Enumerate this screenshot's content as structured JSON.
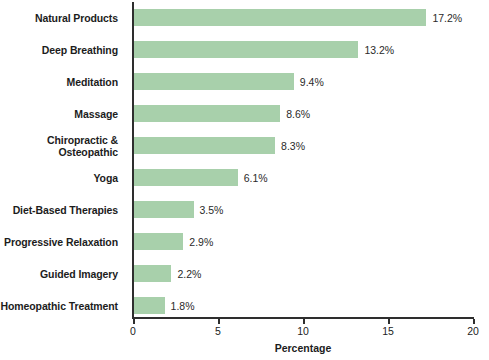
{
  "chart_data": {
    "type": "bar",
    "orientation": "horizontal",
    "title": "",
    "xlabel": "Percentage",
    "ylabel": "",
    "xlim": [
      0,
      20
    ],
    "xticks": [
      "0",
      "5",
      "10",
      "15",
      "20"
    ],
    "grid": false,
    "legend": false,
    "bar_color": "#a8d0ab",
    "axis_color": "#2e2e2e",
    "categories": [
      "Natural Products",
      "Deep Breathing",
      "Meditation",
      "Massage",
      "Chiropractic & Osteopathic",
      "Yoga",
      "Diet-Based Therapies",
      "Progressive Relaxation",
      "Guided Imagery",
      "Homeopathic Treatment"
    ],
    "values": [
      17.2,
      13.2,
      9.4,
      8.6,
      8.3,
      6.1,
      3.5,
      2.9,
      2.2,
      1.8
    ],
    "value_labels": [
      "17.2%",
      "13.2%",
      "9.4%",
      "8.6%",
      "8.3%",
      "6.1%",
      "3.5%",
      "2.9%",
      "2.2%",
      "1.8%"
    ],
    "category_label_lines": [
      [
        "Natural Products"
      ],
      [
        "Deep Breathing"
      ],
      [
        "Meditation"
      ],
      [
        "Massage"
      ],
      [
        "Chiropractic &",
        "Osteopathic"
      ],
      [
        "Yoga"
      ],
      [
        "Diet-Based Therapies"
      ],
      [
        "Progressive Relaxation"
      ],
      [
        "Guided Imagery"
      ],
      [
        "Homeopathic Treatment"
      ]
    ]
  }
}
